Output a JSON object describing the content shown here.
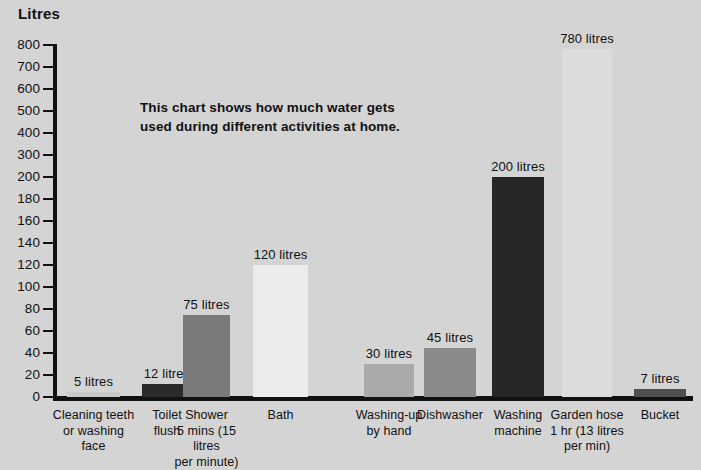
{
  "axis": {
    "y_title": "Litres",
    "tick_labels": [
      "800",
      "700",
      "600",
      "500",
      "400",
      "300",
      "200",
      "180",
      "160",
      "140",
      "120",
      "100",
      "80",
      "60",
      "40",
      "20",
      "0"
    ]
  },
  "annotation": {
    "line1": "This chart shows how much water gets",
    "line2": "used during different activities at home."
  },
  "chart_data": {
    "type": "bar",
    "title": "",
    "xlabel": "",
    "ylabel": "Litres",
    "ylim": [
      0,
      800
    ],
    "grid": false,
    "legend": "none",
    "note": "Y axis uses a broken / compressed scale: 20-litre steps from 0 to 200, then 100-litre steps from 200 to 800.",
    "y_ticks": [
      0,
      20,
      40,
      60,
      80,
      100,
      120,
      140,
      160,
      180,
      200,
      300,
      400,
      500,
      600,
      700,
      800
    ],
    "categories": [
      "Cleaning teeth or washing face",
      "Toilet flush",
      "Shower 5 mins (15 litres per minute)",
      "Bath",
      "Washing-up by hand",
      "Dishwasher",
      "Washing machine",
      "Garden hose 1 hr (13 litres per min)",
      "Bucket"
    ],
    "category_lines": [
      [
        "Cleaning teeth",
        "or washing face"
      ],
      [
        "Toilet",
        "flush"
      ],
      [
        "Shower",
        "5 mins (15 litres",
        "per minute)"
      ],
      [
        "Bath"
      ],
      [
        "Washing-up",
        "by hand"
      ],
      [
        "Dishwasher"
      ],
      [
        "Washing",
        "machine"
      ],
      [
        "Garden hose",
        "1 hr (13 litres",
        "per min)"
      ],
      [
        "Bucket"
      ]
    ],
    "values": [
      5,
      12,
      75,
      120,
      30,
      45,
      200,
      780,
      7
    ],
    "value_labels": [
      "5 litres",
      "12 litres",
      "75 litres",
      "120 litres",
      "30 litres",
      "45 litres",
      "200 litres",
      "780 litres",
      "7 litres"
    ],
    "bar_colors": [
      "#c9c9c9",
      "#2b2b2b",
      "#7a7a7a",
      "#ececec",
      "#aaaaaa",
      "#8a8a8a",
      "#262626",
      "#dcdcdc",
      "#4e4e4e"
    ]
  },
  "colors": {
    "background": "#d4d4d4",
    "axis": "#111111",
    "text": "#111111"
  }
}
